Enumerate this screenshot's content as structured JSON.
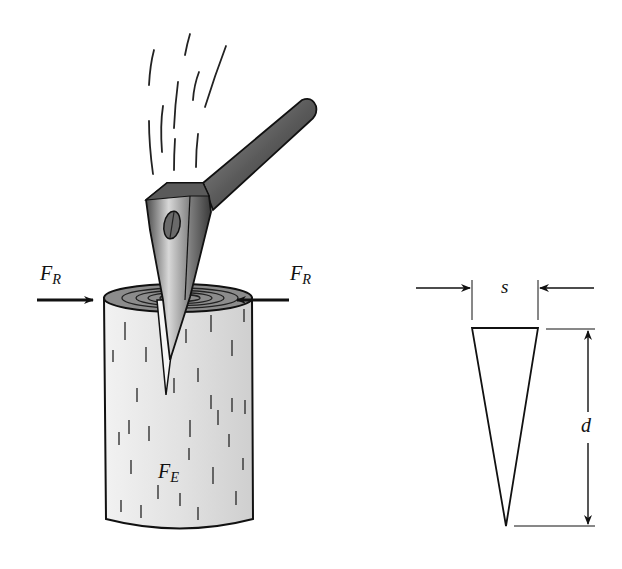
{
  "figure": {
    "left_panel": {
      "labels": {
        "force_resistance_left": {
          "symbol": "F",
          "subscript": "R"
        },
        "force_resistance_right": {
          "symbol": "F",
          "subscript": "R"
        },
        "force_effort": {
          "symbol": "F",
          "subscript": "E"
        }
      },
      "elements": [
        "axe-head",
        "axe-handle",
        "motion-lines",
        "log",
        "log-rings",
        "wood-grain-marks",
        "left-arrow",
        "right-arrow"
      ]
    },
    "right_panel": {
      "labels": {
        "width": "s",
        "depth": "d"
      },
      "elements": [
        "wedge-triangle",
        "width-dimension-arrows",
        "depth-dimension-arrows"
      ]
    },
    "colors": {
      "ink": "#111111",
      "log_fill": "#e6e6e6",
      "log_top": "#8a8a8a",
      "axe_dark": "#3c3c3c",
      "axe_mid": "#8c8c8c",
      "background": "#ffffff"
    }
  }
}
